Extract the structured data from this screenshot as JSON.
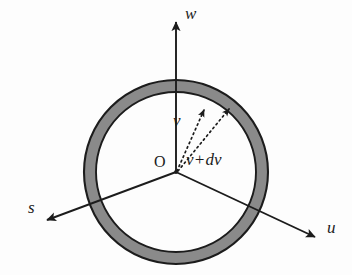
{
  "figure": {
    "background_color": "#fdfdfd",
    "stroke_color": "#1c1c1c",
    "ring_fill_color": "#8a8a8a",
    "geometry": {
      "center_x": 176,
      "center_y": 172,
      "outer_radius": 92,
      "inner_radius": 80
    },
    "annulus": {
      "name": "velocity-shell-annulus",
      "description": "shaded spherical shell of radius v and thickness dv"
    },
    "axes": [
      {
        "id": "w",
        "label": "w",
        "tip_x": 176,
        "tip_y": 18,
        "origin_x": 176,
        "origin_y": 172
      },
      {
        "id": "s",
        "label": "s",
        "tip_x": 42,
        "tip_y": 222,
        "origin_x": 176,
        "origin_y": 172
      },
      {
        "id": "u",
        "label": "u",
        "tip_x": 320,
        "tip_y": 240,
        "origin_x": 176,
        "origin_y": 172
      }
    ],
    "origin": {
      "label": "O",
      "x": 176,
      "y": 172
    },
    "vectors": [
      {
        "id": "v",
        "label": "v",
        "style": "dashed",
        "tip_x": 206,
        "tip_y": 104,
        "origin_x": 176,
        "origin_y": 172
      },
      {
        "id": "v-plus-dv",
        "label": "v+dv",
        "style": "dashed",
        "tip_x": 233,
        "tip_y": 103,
        "origin_x": 176,
        "origin_y": 172
      }
    ]
  }
}
